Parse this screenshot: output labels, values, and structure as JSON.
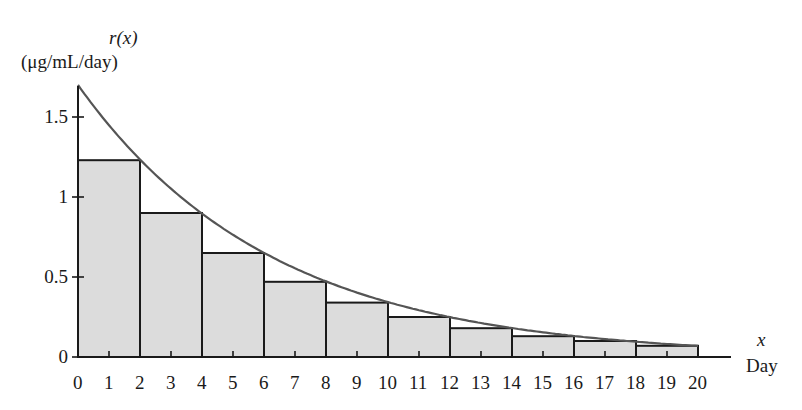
{
  "chart_data": {
    "type": "bar",
    "title": "",
    "ylabel_line1": "r(x)",
    "ylabel_line2": "(μg/mL/day)",
    "xlabel_line1": "x",
    "xlabel_line2": "Day",
    "xlim": [
      0,
      20
    ],
    "ylim": [
      0,
      1.7
    ],
    "x_ticks": [
      0,
      1,
      2,
      3,
      4,
      5,
      6,
      7,
      8,
      9,
      10,
      11,
      12,
      13,
      14,
      15,
      16,
      17,
      18,
      19,
      20
    ],
    "y_ticks": [
      {
        "value": 0,
        "label": "0"
      },
      {
        "value": 0.5,
        "label": "0.5"
      },
      {
        "value": 1,
        "label": "1"
      },
      {
        "value": 1.5,
        "label": "1.5"
      }
    ],
    "curve": {
      "name": "r(x) ≈ 1.7e^(-0.16x)",
      "x": [
        0,
        1,
        2,
        3,
        4,
        5,
        6,
        7,
        8,
        9,
        10,
        11,
        12,
        13,
        14,
        15,
        16,
        17,
        18,
        19,
        20
      ],
      "y": [
        1.7,
        1.449,
        1.234,
        1.052,
        0.896,
        0.764,
        0.651,
        0.555,
        0.473,
        0.403,
        0.343,
        0.293,
        0.249,
        0.212,
        0.181,
        0.154,
        0.131,
        0.112,
        0.095,
        0.081,
        0.069
      ]
    },
    "series": [
      {
        "name": "Right-endpoint rectangles (width 2 days)",
        "intervals": [
          [
            0,
            2
          ],
          [
            2,
            4
          ],
          [
            4,
            6
          ],
          [
            6,
            8
          ],
          [
            8,
            10
          ],
          [
            10,
            12
          ],
          [
            12,
            14
          ],
          [
            14,
            16
          ],
          [
            16,
            18
          ],
          [
            18,
            20
          ]
        ],
        "values": [
          1.23,
          0.9,
          0.65,
          0.47,
          0.34,
          0.25,
          0.18,
          0.13,
          0.1,
          0.07
        ]
      }
    ],
    "colors": {
      "fill": "#dcdcdc",
      "curve": "#555555",
      "axis": "#1a1a1a"
    },
    "grid": false
  }
}
